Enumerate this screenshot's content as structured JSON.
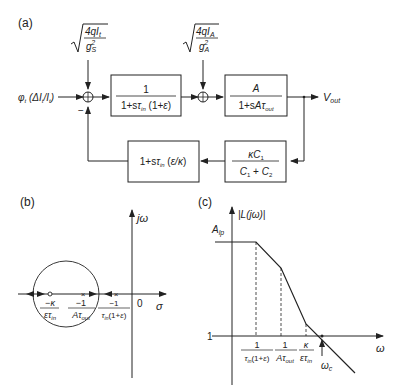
{
  "panel_a": {
    "label": "(a)",
    "input_signal": "φt (ΔIt/It)",
    "noise1": {
      "num": "4qIt",
      "den": "g²S"
    },
    "noise2": {
      "num": "4qIA",
      "den": "g²A"
    },
    "block1": {
      "num": "1",
      "den": "1+sτin (1+ε)"
    },
    "block2": {
      "num": "A",
      "den": "1+sAτout"
    },
    "output": "Vout",
    "feedback_block1": {
      "num": "κC1",
      "den": "C1 + C2"
    },
    "feedback_block2": "1+sτin (ε/κ)",
    "minus_sign": "−"
  },
  "panel_b": {
    "label": "(b)",
    "y_axis": "jω",
    "x_axis": "σ",
    "origin": "0",
    "zero_label": {
      "num": "−κ",
      "den": "ετin"
    },
    "pole1_label": {
      "num": "−1",
      "den": "Aτout"
    },
    "pole2_label": {
      "num": "−1",
      "den": "τin(1+ε)"
    }
  },
  "panel_c": {
    "label": "(c)",
    "y_axis": "|L(jω)|",
    "x_axis": "ω",
    "y_tick_top": "Alp",
    "y_tick_unity": "1",
    "x_ticks": [
      {
        "num": "1",
        "den": "τin(1+ε)"
      },
      {
        "num": "1",
        "den": "Aτout"
      },
      {
        "num": "κ",
        "den": "ετin"
      }
    ],
    "crossover": "ωc"
  }
}
